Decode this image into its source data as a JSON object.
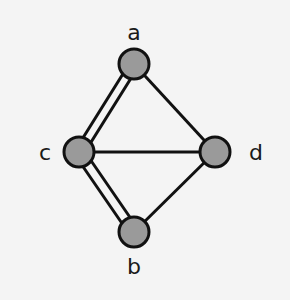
{
  "diagram": {
    "type": "graph",
    "colors": {
      "background": "#f4f4f4",
      "node_fill": "#9a9a9a",
      "stroke": "#111111",
      "text": "#1a1a1a"
    },
    "nodes": [
      {
        "id": "a",
        "label": "a",
        "x": 134,
        "y": 64
      },
      {
        "id": "c",
        "label": "c",
        "x": 79,
        "y": 152
      },
      {
        "id": "d",
        "label": "d",
        "x": 215,
        "y": 152
      },
      {
        "id": "b",
        "label": "b",
        "x": 134,
        "y": 232
      }
    ],
    "edges": [
      {
        "from": "a",
        "to": "c",
        "multiplicity": 2
      },
      {
        "from": "a",
        "to": "d",
        "multiplicity": 1
      },
      {
        "from": "c",
        "to": "d",
        "multiplicity": 1
      },
      {
        "from": "c",
        "to": "b",
        "multiplicity": 2
      },
      {
        "from": "b",
        "to": "d",
        "multiplicity": 1
      }
    ]
  }
}
